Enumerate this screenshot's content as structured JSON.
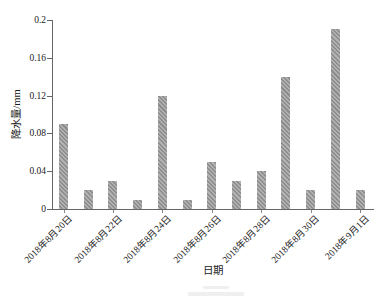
{
  "chart_data": {
    "type": "bar",
    "title": "",
    "xlabel": "日期",
    "ylabel": "降水量/mm",
    "categories": [
      "2018年8月20日",
      "2018年8月21日",
      "2018年8月22日",
      "2018年8月23日",
      "2018年8月24日",
      "2018年8月25日",
      "2018年8月26日",
      "2018年8月27日",
      "2018年8月28日",
      "2018年8月29日",
      "2018年8月30日",
      "2018年8月31日",
      "2018年9月1日"
    ],
    "values": [
      0.09,
      0.02,
      0.03,
      0.01,
      0.12,
      0.01,
      0.05,
      0.03,
      0.04,
      0.14,
      0.02,
      0.19,
      0.02
    ],
    "x_tick_labels": [
      "2018年8月20日",
      "2018年8月22日",
      "2018年8月24日",
      "2018年8月26日",
      "2018年8月28日",
      "2018年8月30日",
      "2018年9月1日"
    ],
    "x_tick_step": 2,
    "y_tick_labels": [
      "0",
      "0.04",
      "0.08",
      "0.12",
      "0.16",
      "0.2"
    ],
    "y_ticks": [
      0,
      0.04,
      0.08,
      0.12,
      0.16,
      0.2
    ],
    "ylim": [
      0,
      0.2
    ],
    "grid": false,
    "legend": "none",
    "bar_color": "#a9a9a9",
    "bar_hatch": "diagonal",
    "bar_hatch_color": "#8e8e8e",
    "axis_color": "#666666"
  }
}
